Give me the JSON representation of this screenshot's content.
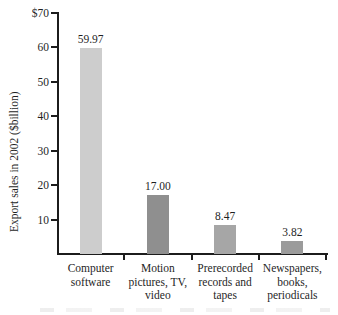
{
  "colors": {
    "axis": "#1c1c1c",
    "text": "#1f1f1f",
    "background": "#ffffff"
  },
  "chart_data": {
    "type": "bar",
    "title": "",
    "xlabel": "",
    "ylabel": "Export sales in 2002 ($billion)",
    "ylim": [
      0,
      70
    ],
    "grid": false,
    "legend": null,
    "yticks": [
      10,
      20,
      30,
      40,
      50,
      60,
      70
    ],
    "ytick_labels": [
      "10",
      "20",
      "30",
      "40",
      "50",
      "60",
      "$70"
    ],
    "categories": [
      "Computer\nsoftware",
      "Motion\npictures, TV,\nvideo",
      "Prerecorded\nrecords and\ntapes",
      "Newspapers,\nbooks,\nperiodicals"
    ],
    "values": [
      59.97,
      17.0,
      8.47,
      3.82
    ],
    "value_labels": [
      "59.97",
      "17.00",
      "8.47",
      "3.82"
    ],
    "bar_colors": [
      "#cdcdcd",
      "#8f8f8f",
      "#a6a6a6",
      "#9b9b9b"
    ]
  }
}
